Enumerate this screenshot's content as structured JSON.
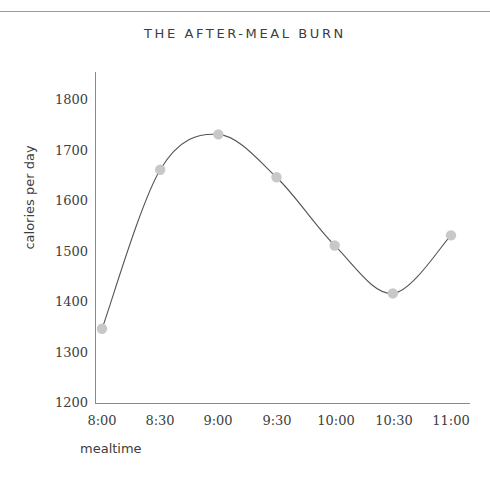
{
  "chart_data": {
    "type": "line",
    "title": "THE AFTER-MEAL BURN",
    "xlabel": "mealtime",
    "ylabel": "calories per day",
    "categories": [
      "8:00",
      "8:30",
      "9:00",
      "9:30",
      "10:00",
      "10:30",
      "11:00"
    ],
    "x": [
      8.0,
      8.5,
      9.0,
      9.5,
      10.0,
      10.5,
      11.0
    ],
    "values": [
      1345,
      1660,
      1730,
      1645,
      1510,
      1415,
      1530
    ],
    "series": [
      {
        "name": "calories per day",
        "values": [
          1345,
          1660,
          1730,
          1645,
          1510,
          1415,
          1530
        ]
      }
    ],
    "ylim": [
      1200,
      1800
    ],
    "yticks": [
      1200,
      1300,
      1400,
      1500,
      1600,
      1700,
      1800
    ],
    "ytick_labels": [
      "1200",
      "1300",
      "1400",
      "1500",
      "1600",
      "1700",
      "1800"
    ],
    "xtick_labels": [
      "8:00",
      "8:30",
      "9:00",
      "9:30",
      "10:00",
      "10:30",
      "11:00"
    ],
    "grid": false,
    "legend": false,
    "legend_position": "none",
    "line_color": "#555555",
    "marker_color": "#c8c8c8",
    "axis_color": "#8a8a8a",
    "background_color": "#ffffff",
    "smoothing": "spline",
    "note": "Peak value occurs between the 8:30 and 9:00 ticks"
  },
  "figure": {
    "top_rule_color": "#9a9a9a"
  }
}
